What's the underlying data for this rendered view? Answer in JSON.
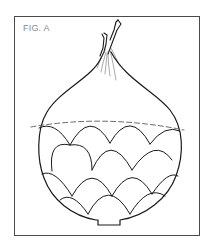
{
  "figure": {
    "label": "FIG. A",
    "stroke_color": "#1a1a1a",
    "frame_color": "#4a4a4a",
    "label_color": "#8a8a8a"
  }
}
